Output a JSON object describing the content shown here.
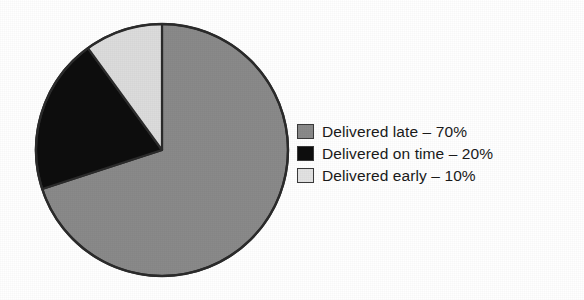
{
  "chart_data": {
    "type": "pie",
    "title": "",
    "subtitle": "",
    "xlabel": "",
    "ylabel": "",
    "grid": false,
    "legend_position": "right",
    "start_angle_deg": 0,
    "direction": "clockwise",
    "units": "%",
    "categories": [
      "Delivered late",
      "Delivered on time",
      "Delivered early"
    ],
    "values": [
      70,
      20,
      10
    ],
    "slices": [
      {
        "label": "Delivered late",
        "value": 70,
        "value_text": "70%",
        "color": "#8a8a8a",
        "start_deg": 0,
        "end_deg": 252
      },
      {
        "label": "Delivered on time",
        "value": 20,
        "value_text": "20%",
        "color": "#0d0d0d",
        "start_deg": 252,
        "end_deg": 324
      },
      {
        "label": "Delivered early",
        "value": 10,
        "value_text": "10%",
        "color": "#dcdcdc",
        "start_deg": 324,
        "end_deg": 360
      }
    ]
  },
  "legend": {
    "items": [
      {
        "text": "Delivered late – 70%",
        "swatch_color": "#8a8a8a",
        "swatch_border": "#3a3a3a"
      },
      {
        "text": "Delivered on time – 20%",
        "swatch_color": "#0d0d0d",
        "swatch_border": "#3a3a3a"
      },
      {
        "text": "Delivered early – 10%",
        "swatch_color": "#e2e2e2",
        "swatch_border": "#3a3a3a"
      }
    ]
  },
  "style": {
    "background": "#ffffff",
    "outline": "#2b2b2b",
    "text": "#1a1a1a"
  }
}
